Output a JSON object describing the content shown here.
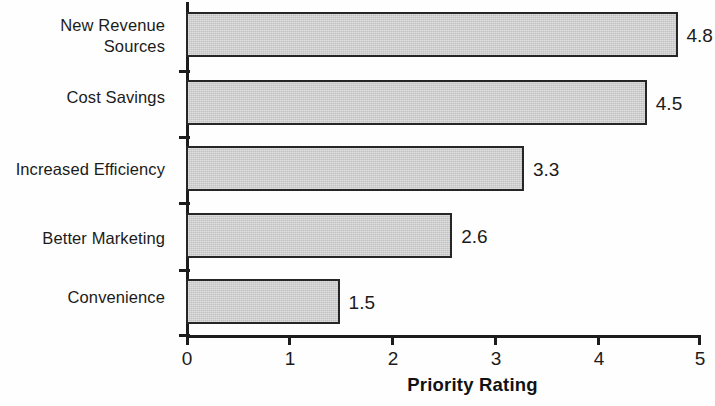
{
  "chart_data": {
    "type": "bar",
    "orientation": "horizontal",
    "title": "",
    "xlabel": "Priority Rating",
    "ylabel": "",
    "categories": [
      "New Revenue\nSources",
      "Cost Savings",
      "Increased Efficiency",
      "Better Marketing",
      "Convenience"
    ],
    "values": [
      4.8,
      4.5,
      3.3,
      2.6,
      1.5
    ],
    "value_labels": [
      "4.8",
      "4.5",
      "3.3",
      "2.6",
      "1.5"
    ],
    "xlim": [
      0,
      5
    ],
    "xticks": [
      0,
      1,
      2,
      3,
      4,
      5
    ],
    "xtick_labels": [
      "0",
      "1",
      "2",
      "3",
      "4",
      "5"
    ],
    "grid": false,
    "legend": false,
    "bar_fill_color": "#c2c2c2",
    "bar_border_color": "#262626",
    "axis_color": "#1c1c1c",
    "background_color": "#fefefe"
  },
  "bars": [
    {
      "label": "New Revenue\nSources",
      "value": 4.8,
      "value_label": "4.8"
    },
    {
      "label": "Cost Savings",
      "value": 4.5,
      "value_label": "4.5"
    },
    {
      "label": "Increased Efficiency",
      "value": 3.3,
      "value_label": "3.3"
    },
    {
      "label": "Better Marketing",
      "value": 2.6,
      "value_label": "2.6"
    },
    {
      "label": "Convenience",
      "value": 1.5,
      "value_label": "1.5"
    }
  ],
  "axis": {
    "x_title": "Priority Rating",
    "x_tick_labels": [
      "0",
      "1",
      "2",
      "3",
      "4",
      "5"
    ]
  }
}
